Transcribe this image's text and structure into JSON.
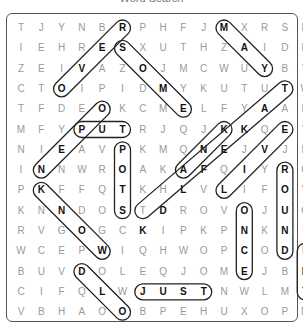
{
  "title": "Word Search",
  "grid": [
    [
      "T",
      "J",
      "Y",
      "N",
      "B",
      "R",
      "P",
      "H",
      "F",
      "J",
      "M",
      "X",
      "R",
      "S",
      "H"
    ],
    [
      "I",
      "E",
      "H",
      "R",
      "E",
      "S",
      "X",
      "U",
      "T",
      "H",
      "Z",
      "A",
      "I",
      "D",
      "R"
    ],
    [
      "Z",
      "E",
      "I",
      "V",
      "A",
      "Z",
      "O",
      "J",
      "M",
      "C",
      "W",
      "U",
      "Y",
      "B",
      "Y"
    ],
    [
      "C",
      "T",
      "O",
      "I",
      "P",
      "I",
      "D",
      "M",
      "Y",
      "K",
      "U",
      "T",
      "U",
      "T",
      "W"
    ],
    [
      "T",
      "F",
      "D",
      "E",
      "O",
      "K",
      "C",
      "M",
      "E",
      "L",
      "F",
      "Y",
      "A",
      "A",
      "H"
    ],
    [
      "M",
      "F",
      "Y",
      "P",
      "U",
      "T",
      "R",
      "J",
      "Q",
      "J",
      "K",
      "K",
      "Q",
      "E",
      "Y"
    ],
    [
      "N",
      "I",
      "E",
      "A",
      "V",
      "P",
      "K",
      "M",
      "Q",
      "N",
      "E",
      "J",
      "V",
      "J",
      "D"
    ],
    [
      "I",
      "N",
      "N",
      "W",
      "R",
      "O",
      "A",
      "K",
      "A",
      "F",
      "Q",
      "I",
      "Y",
      "R",
      "G"
    ],
    [
      "P",
      "K",
      "F",
      "F",
      "Q",
      "T",
      "K",
      "H",
      "L",
      "V",
      "L",
      "I",
      "F",
      "O",
      "V"
    ],
    [
      "K",
      "N",
      "N",
      "D",
      "O",
      "S",
      "T",
      "D",
      "R",
      "O",
      "V",
      "O",
      "J",
      "U",
      "G"
    ],
    [
      "R",
      "V",
      "G",
      "O",
      "G",
      "C",
      "K",
      "I",
      "P",
      "K",
      "P",
      "N",
      "K",
      "N",
      "F"
    ],
    [
      "W",
      "C",
      "E",
      "P",
      "W",
      "I",
      "Q",
      "H",
      "W",
      "O",
      "P",
      "C",
      "O",
      "D",
      "L"
    ],
    [
      "B",
      "U",
      "V",
      "D",
      "O",
      "L",
      "E",
      "Q",
      "J",
      "O",
      "M",
      "E",
      "J",
      "B",
      "E"
    ],
    [
      "C",
      "I",
      "F",
      "Q",
      "L",
      "W",
      "J",
      "U",
      "S",
      "T",
      "N",
      "W",
      "L",
      "M",
      "T"
    ],
    [
      "V",
      "B",
      "H",
      "A",
      "O",
      "O",
      "B",
      "P",
      "E",
      "H",
      "U",
      "X",
      "O",
      "P",
      "M"
    ]
  ],
  "found_words": [
    {
      "word": "ROVE",
      "start": [
        0,
        5
      ],
      "end": [
        3,
        2
      ]
    },
    {
      "word": "SOME",
      "start": [
        1,
        5
      ],
      "end": [
        4,
        8
      ]
    },
    {
      "word": "MAY",
      "start": [
        0,
        10
      ],
      "end": [
        2,
        12
      ]
    },
    {
      "word": "PUT",
      "start": [
        5,
        3
      ],
      "end": [
        5,
        5
      ]
    },
    {
      "word": "POTS",
      "start": [
        6,
        5
      ],
      "end": [
        9,
        5
      ]
    },
    {
      "word": "KNOW",
      "start": [
        8,
        1
      ],
      "end": [
        11,
        4
      ]
    },
    {
      "word": "OEN",
      "start": [
        4,
        4
      ],
      "end": [
        7,
        1
      ]
    },
    {
      "word": "KNAK",
      "start": [
        5,
        10
      ],
      "end": [
        7,
        8
      ]
    },
    {
      "word": "THAT",
      "start": [
        3,
        13
      ],
      "end": [
        9,
        6
      ]
    },
    {
      "word": "LIVE",
      "start": [
        8,
        10
      ],
      "end": [
        5,
        13
      ]
    },
    {
      "word": "ROUND",
      "start": [
        7,
        13
      ],
      "end": [
        11,
        13
      ]
    },
    {
      "word": "ONCE",
      "start": [
        9,
        11
      ],
      "end": [
        12,
        11
      ]
    },
    {
      "word": "LET",
      "start": [
        11,
        14
      ],
      "end": [
        13,
        14
      ]
    },
    {
      "word": "DLO",
      "start": [
        12,
        3
      ],
      "end": [
        14,
        5
      ]
    },
    {
      "word": "JUST",
      "start": [
        13,
        6
      ],
      "end": [
        13,
        9
      ]
    }
  ]
}
